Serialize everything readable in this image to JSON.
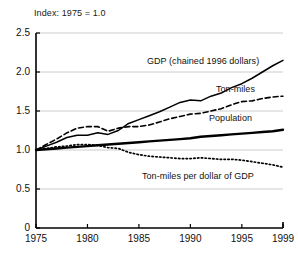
{
  "chart_data": {
    "type": "line",
    "title": "",
    "subtitle": "Index: 1975 = 1.0",
    "xlabel": "",
    "ylabel": "",
    "xlim": [
      1975,
      1999
    ],
    "ylim": [
      0,
      2.5
    ],
    "grid": true,
    "legend_position": "inline-labels",
    "x_ticks": [
      "1975",
      "1980",
      "1985",
      "1990",
      "1995",
      "1999"
    ],
    "x_tick_values": [
      1975,
      1980,
      1985,
      1990,
      1995,
      1999
    ],
    "y_ticks": [
      "0",
      "0.5",
      "1.0",
      "1.5",
      "2.0",
      "2.5"
    ],
    "y_tick_values": [
      0,
      0.5,
      1.0,
      1.5,
      2.0,
      2.5
    ],
    "x": [
      1975,
      1976,
      1977,
      1978,
      1979,
      1980,
      1981,
      1982,
      1983,
      1984,
      1985,
      1986,
      1987,
      1988,
      1989,
      1990,
      1991,
      1992,
      1993,
      1994,
      1995,
      1996,
      1997,
      1998,
      1999
    ],
    "series": [
      {
        "name": "GDP (chained 1996 dollars)",
        "style": "solid",
        "label": "GDP (chained 1996 dollars)",
        "values": [
          1.0,
          1.05,
          1.1,
          1.16,
          1.19,
          1.19,
          1.22,
          1.2,
          1.25,
          1.34,
          1.39,
          1.44,
          1.49,
          1.55,
          1.61,
          1.64,
          1.63,
          1.69,
          1.73,
          1.8,
          1.85,
          1.92,
          2.0,
          2.08,
          2.15
        ]
      },
      {
        "name": "Ton-miles",
        "style": "dashed",
        "label": "Ton-miles",
        "values": [
          1.0,
          1.07,
          1.14,
          1.22,
          1.28,
          1.3,
          1.3,
          1.24,
          1.28,
          1.3,
          1.3,
          1.32,
          1.36,
          1.4,
          1.43,
          1.46,
          1.47,
          1.5,
          1.53,
          1.58,
          1.62,
          1.63,
          1.66,
          1.68,
          1.69
        ]
      },
      {
        "name": "Population",
        "style": "solid-thick",
        "label": "Population",
        "values": [
          1.0,
          1.01,
          1.02,
          1.03,
          1.04,
          1.05,
          1.06,
          1.07,
          1.08,
          1.09,
          1.1,
          1.11,
          1.12,
          1.13,
          1.14,
          1.15,
          1.17,
          1.18,
          1.19,
          1.2,
          1.21,
          1.22,
          1.23,
          1.24,
          1.26
        ]
      },
      {
        "name": "Ton-miles per dollar of GDP",
        "style": "dotted",
        "label": "Ton-miles per dollar of GDP",
        "values": [
          1.0,
          1.02,
          1.04,
          1.05,
          1.07,
          1.07,
          1.06,
          1.03,
          1.02,
          0.97,
          0.94,
          0.92,
          0.91,
          0.9,
          0.89,
          0.89,
          0.9,
          0.89,
          0.88,
          0.88,
          0.87,
          0.85,
          0.83,
          0.81,
          0.78
        ]
      }
    ],
    "colors": {
      "line": "#000000",
      "grid": "#cccccc",
      "axis": "#000000",
      "text": "#111111",
      "background": "#ffffff"
    }
  },
  "labels": {
    "gdp": "GDP (chained 1996 dollars)",
    "ton_miles": "Ton-miles",
    "population": "Population",
    "ton_miles_per_dollar": "Ton-miles per dollar of GDP"
  }
}
